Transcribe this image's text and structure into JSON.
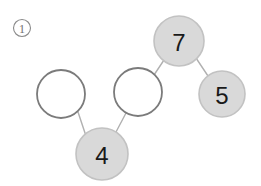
{
  "figure": {
    "marker": {
      "label": "1",
      "cx": 22,
      "cy": 28,
      "r": 8.5
    },
    "background_color": "#ffffff",
    "filled_node_color": "#d9d9d9",
    "filled_node_border_color": "#c2c2c2",
    "empty_node_border_color": "#7b7b7b",
    "edge_color": "#b0b0b0",
    "label_color": "#1a1a1a"
  },
  "nodes": [
    {
      "id": "left-empty",
      "label": "",
      "filled": false,
      "cx": 61,
      "cy": 94,
      "r": 24
    },
    {
      "id": "middle-empty",
      "label": "",
      "filled": false,
      "cx": 138,
      "cy": 92,
      "r": 24
    },
    {
      "id": "node-four",
      "label": "4",
      "filled": true,
      "cx": 102,
      "cy": 154,
      "r": 26
    },
    {
      "id": "node-seven",
      "label": "7",
      "filled": true,
      "cx": 179,
      "cy": 41,
      "r": 25
    },
    {
      "id": "node-five",
      "label": "5",
      "filled": true,
      "cx": 222,
      "cy": 94,
      "r": 23
    }
  ],
  "edges": [
    {
      "id": "edge-left-four",
      "from": "left-empty",
      "to": "node-four",
      "x1": 78,
      "y1": 112,
      "x2": 86,
      "y2": 136
    },
    {
      "id": "edge-middle-four",
      "from": "middle-empty",
      "to": "node-four",
      "x1": 126,
      "y1": 113,
      "x2": 116,
      "y2": 132
    },
    {
      "id": "edge-middle-seven",
      "from": "middle-empty",
      "to": "node-seven",
      "x1": 154,
      "y1": 75,
      "x2": 164,
      "y2": 60
    },
    {
      "id": "edge-seven-five",
      "from": "node-seven",
      "to": "node-five",
      "x1": 196,
      "y1": 58,
      "x2": 208,
      "y2": 76
    }
  ]
}
